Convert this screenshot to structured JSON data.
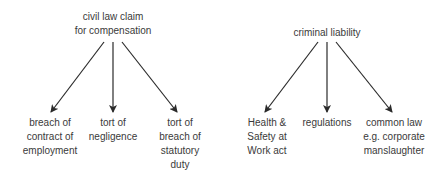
{
  "diagram": {
    "trees": [
      {
        "root": "civil law claim\nfor compensation",
        "children": [
          "breach of\ncontract of\nemployment",
          "tort of\nnegligence",
          "tort of\nbreach of\nstatutory\nduty"
        ]
      },
      {
        "root": "criminal liability",
        "children": [
          "Health &\nSafety at\nWork act",
          "regulations",
          "common law\ne.g. corporate\nmanslaughter"
        ]
      }
    ],
    "colors": {
      "line": "#2a2a2a",
      "text": "#3a3a3a"
    }
  }
}
